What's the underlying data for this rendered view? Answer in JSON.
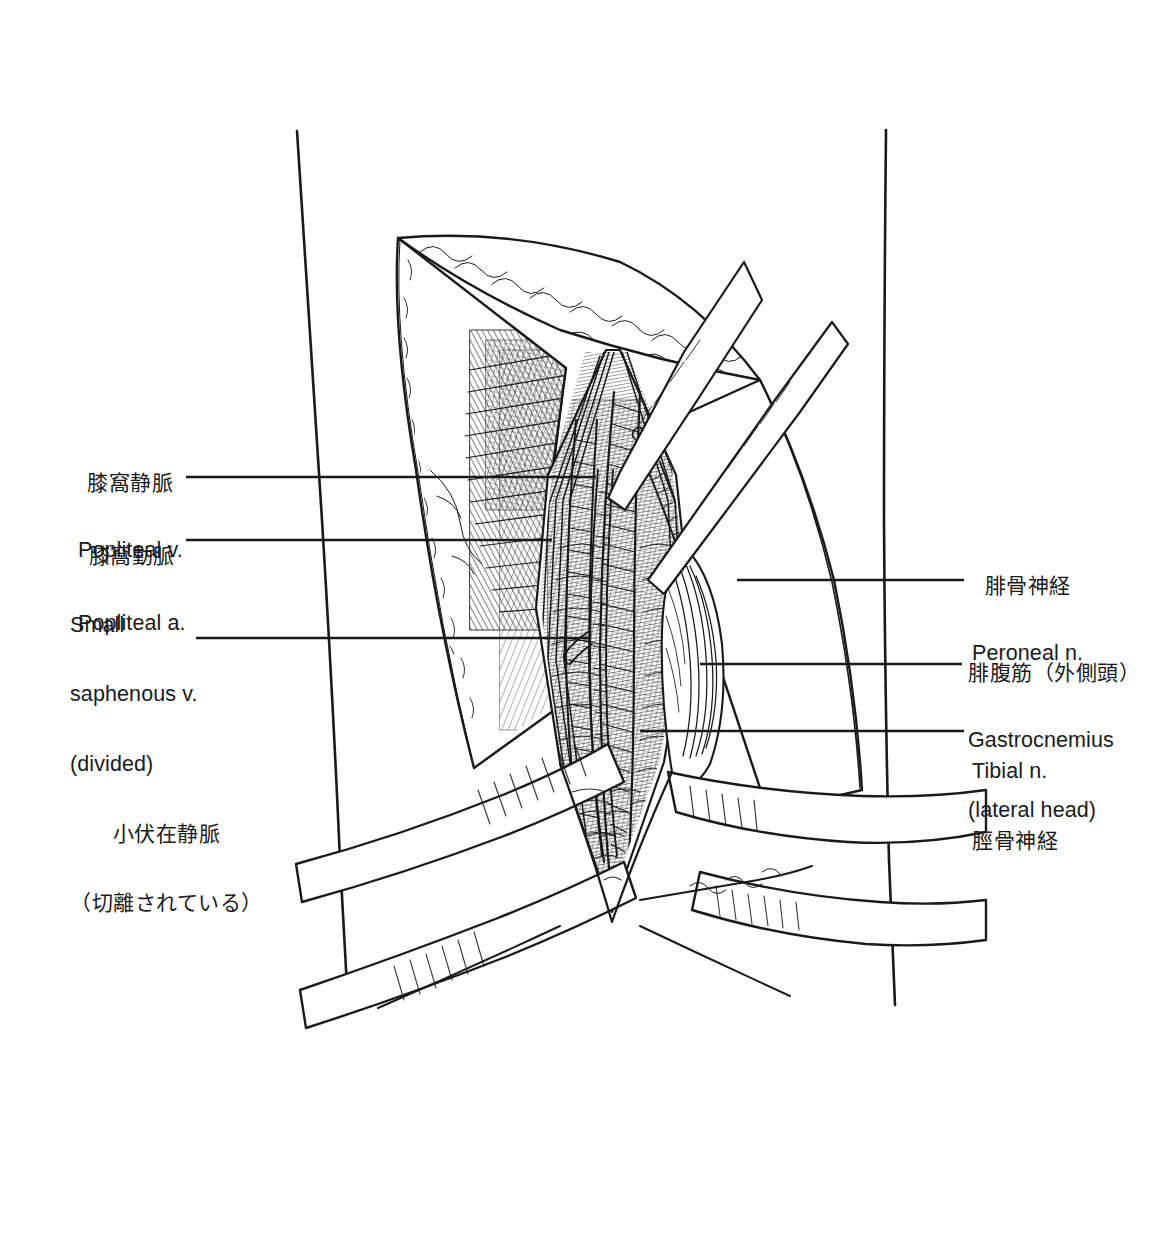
{
  "figure": {
    "kind": "anatomical-line-drawing",
    "style": "black-and-white pen-and-ink hatching",
    "background_color": "#ffffff",
    "ink_color": "#1a1a1a"
  },
  "labels": {
    "left": [
      {
        "id": "popliteal-v",
        "ja": "膝窩静脈",
        "en": "Popliteal v.",
        "leader": {
          "x1": 186,
          "y1": 477,
          "x2": 596,
          "y2": 477
        }
      },
      {
        "id": "popliteal-a",
        "ja": "膝窩動脈",
        "en": "Popliteal a.",
        "leader": {
          "x1": 186,
          "y1": 540,
          "x2": 552,
          "y2": 540
        }
      },
      {
        "id": "small-saphenous-v",
        "en_line1": "Small",
        "en_line2": "saphenous v.",
        "en_line3": "(divided)",
        "ja_line1": "小伏在静脈",
        "ja_line2": "（切離されている）",
        "leader": {
          "x1": 196,
          "y1": 638,
          "x2": 590,
          "y2": 638
        }
      }
    ],
    "right": [
      {
        "id": "peroneal-n",
        "ja": "腓骨神経",
        "en": "Peroneal n.",
        "leader": {
          "x1": 737,
          "y1": 580,
          "x2": 964,
          "y2": 580
        }
      },
      {
        "id": "gastrocnemius",
        "ja": "腓腹筋（外側頭）",
        "en_line1": "Gastrocnemius",
        "en_line2": "(lateral head)",
        "leader": {
          "x1": 700,
          "y1": 664,
          "x2": 962,
          "y2": 664
        }
      },
      {
        "id": "tibial-n",
        "en": "Tibial n.",
        "ja": "脛骨神経",
        "leader": {
          "x1": 640,
          "y1": 731,
          "x2": 964,
          "y2": 731
        }
      }
    ]
  }
}
